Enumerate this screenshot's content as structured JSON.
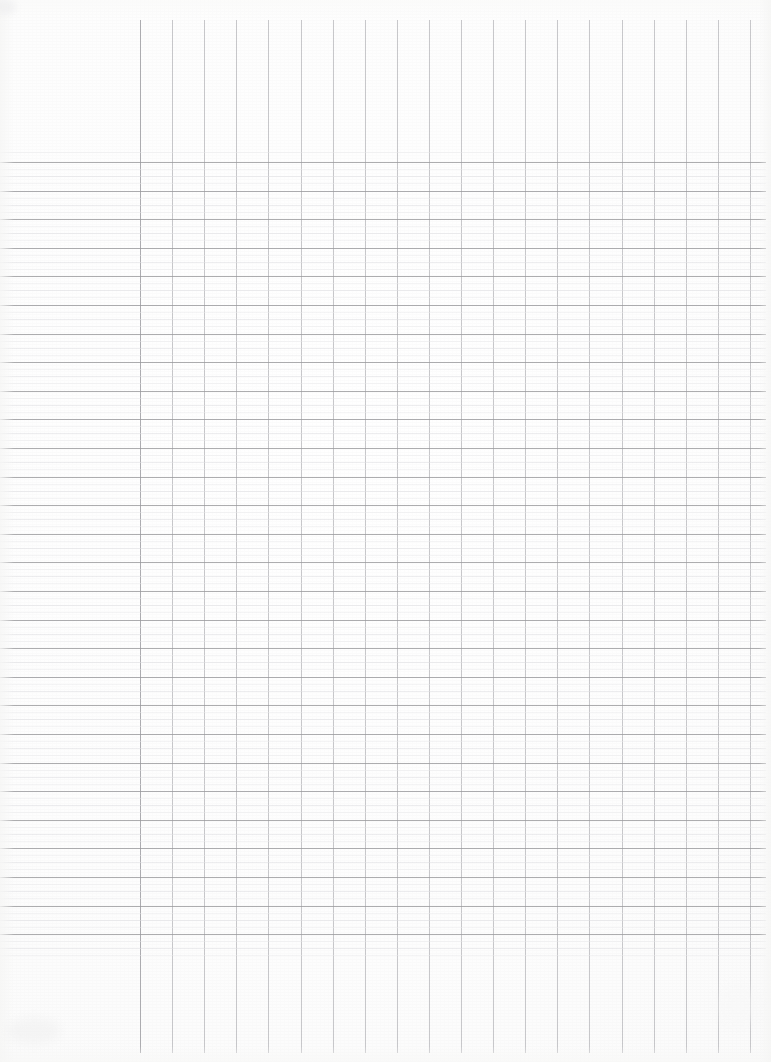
{
  "document": {
    "kind": "scanned-blank-grid-paper",
    "title": "Blank Grid Ledger Paper",
    "content_text": "",
    "page_width": 771,
    "page_height": 1062
  },
  "colors": {
    "paper": "#fefefe",
    "paper_edge": "#f7f7f6",
    "major_rule": "#9b9b9e",
    "minor_rule": "#dedee1",
    "faint_rule": "#e8e8ea",
    "column_rule": "#b9b9bd",
    "margin_rule": "#a4a4a8"
  },
  "grid": {
    "horizontal_rules": {
      "major_start_y": 162,
      "major_end_y": 934,
      "major_spacing": 28.6,
      "major_count": 28,
      "minor_per_major": 3,
      "left_x": 0,
      "right_x": 766
    },
    "vertical_rules": {
      "first_x": 140,
      "last_x": 750,
      "spacing": 32.1,
      "count": 20,
      "top_y": 20,
      "bottom_y": 1053,
      "margin_rule_index": 0
    }
  },
  "regions": {
    "header_blank": {
      "label": "blank header area",
      "y_top": 0,
      "y_bottom": 150
    },
    "ruled_body": {
      "label": "ruled writing body",
      "y_top": 150,
      "y_bottom": 940
    },
    "footer_blank": {
      "label": "blank footer area",
      "y_top": 940,
      "y_bottom": 1062
    },
    "left_margin": {
      "label": "left margin column",
      "x_left": 0,
      "x_right": 140
    }
  }
}
